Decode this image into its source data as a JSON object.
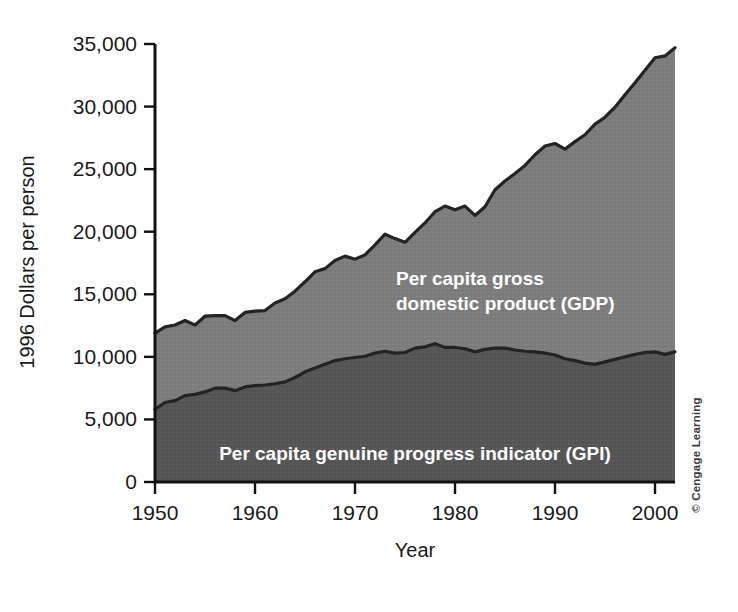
{
  "figure": {
    "background_color": "#ffffff",
    "credit": "© Cengage Learning"
  },
  "axes": {
    "y_title": "1996 Dollars per person",
    "x_title": "Year",
    "y_tick_labels": [
      "35,000",
      "30,000",
      "25,000",
      "20,000",
      "15,000",
      "10,000",
      "5,000",
      "0"
    ],
    "x_tick_labels": [
      "1950",
      "1960",
      "1970",
      "1980",
      "1990",
      "2000"
    ]
  },
  "labels": {
    "gdp_line1": "Per capita gross",
    "gdp_line2": "domestic product (GDP)",
    "gpi": "Per capita genuine progress indicator (GPI)"
  },
  "colors": {
    "gdp_band": "#7d7d7d",
    "gpi_band": "#565656",
    "outline": "#232323",
    "axis": "#111111",
    "label_text": "#ffffff",
    "tick_text": "#1a1a1a"
  },
  "chart_data": {
    "type": "area",
    "title": "",
    "subtitle": "",
    "xlabel": "Year",
    "ylabel": "1996 Dollars per person",
    "xlim": [
      1950,
      2002
    ],
    "ylim": [
      0,
      35000
    ],
    "xticks": [
      1950,
      1960,
      1970,
      1980,
      1990,
      2000
    ],
    "yticks": [
      0,
      5000,
      10000,
      15000,
      20000,
      25000,
      30000,
      35000
    ],
    "grid": false,
    "legend": "in-plot annotations",
    "stacking": "overlaid (GDP is total, GPI is sub-band)",
    "x": [
      1950,
      1951,
      1952,
      1953,
      1954,
      1955,
      1956,
      1957,
      1958,
      1959,
      1960,
      1961,
      1962,
      1963,
      1964,
      1965,
      1966,
      1967,
      1968,
      1969,
      1970,
      1971,
      1972,
      1973,
      1974,
      1975,
      1976,
      1977,
      1978,
      1979,
      1980,
      1981,
      1982,
      1983,
      1984,
      1985,
      1986,
      1987,
      1988,
      1989,
      1990,
      1991,
      1992,
      1993,
      1994,
      1995,
      1996,
      1997,
      1998,
      1999,
      2000,
      2001,
      2002
    ],
    "series": [
      {
        "name": "Per capita gross domestic product (GDP)",
        "values": [
          11900,
          12400,
          12550,
          12900,
          12550,
          13250,
          13300,
          13300,
          12900,
          13550,
          13650,
          13700,
          14300,
          14650,
          15250,
          16000,
          16800,
          17050,
          17700,
          18050,
          17800,
          18150,
          18950,
          19800,
          19450,
          19150,
          19950,
          20700,
          21600,
          22050,
          21750,
          22050,
          21300,
          22000,
          23350,
          24050,
          24650,
          25300,
          26150,
          26850,
          27050,
          26600,
          27200,
          27750,
          28600,
          29150,
          29950,
          30950,
          31900,
          32900,
          33900,
          34050,
          34700
        ]
      },
      {
        "name": "Per capita genuine progress indicator (GPI)",
        "values": [
          5800,
          6350,
          6500,
          6900,
          7000,
          7200,
          7500,
          7500,
          7300,
          7600,
          7700,
          7750,
          7850,
          8000,
          8350,
          8800,
          9100,
          9400,
          9700,
          9850,
          9950,
          10050,
          10300,
          10450,
          10300,
          10350,
          10700,
          10800,
          11050,
          10750,
          10750,
          10650,
          10400,
          10600,
          10700,
          10700,
          10550,
          10450,
          10400,
          10300,
          10150,
          9850,
          9700,
          9500,
          9400,
          9600,
          9800,
          10000,
          10200,
          10350,
          10400,
          10200,
          10400
        ]
      }
    ]
  }
}
